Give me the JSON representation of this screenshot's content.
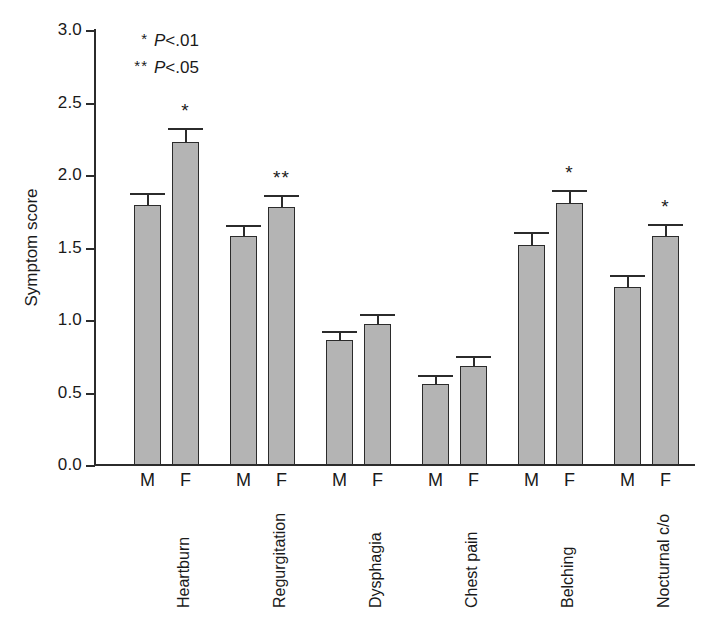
{
  "chart_data": {
    "type": "bar",
    "title": "",
    "xlabel": "",
    "ylabel": "Symptom score",
    "ylim": [
      0.0,
      3.0
    ],
    "ytick_labels": [
      "0.0",
      "0.5",
      "1.0",
      "1.5",
      "2.0",
      "2.5",
      "3.0"
    ],
    "ytick_values": [
      0.0,
      0.5,
      1.0,
      1.5,
      2.0,
      2.5,
      3.0
    ],
    "grid": false,
    "legend": "none",
    "categories": [
      "Heartburn",
      "Regurgitation",
      "Dysphagia",
      "Chest pain",
      "Belching",
      "Nocturnal c/o"
    ],
    "subgroup_labels": [
      "M",
      "F"
    ],
    "series": [
      {
        "name": "M",
        "values": [
          1.79,
          1.58,
          0.86,
          0.56,
          1.52,
          1.23
        ],
        "errors": [
          0.07,
          0.06,
          0.05,
          0.05,
          0.07,
          0.07
        ],
        "significance": [
          "",
          "",
          "",
          "",
          "",
          ""
        ]
      },
      {
        "name": "F",
        "values": [
          2.23,
          1.78,
          0.97,
          0.68,
          1.81,
          1.58
        ],
        "errors": [
          0.08,
          0.07,
          0.06,
          0.06,
          0.07,
          0.07
        ],
        "significance": [
          "*",
          "**",
          "",
          "",
          "*",
          "*"
        ]
      }
    ],
    "annotations": [
      {
        "marker": "*",
        "text": "P<.01",
        "p_italic": "P",
        "p_rest": "<.01"
      },
      {
        "marker": "**",
        "text": "P<.05",
        "p_italic": "P",
        "p_rest": "<.05"
      }
    ],
    "bar_fill_color": "#b4b4b4",
    "bar_edge_color": "#2b2b2b",
    "axis_color": "#2b2b2b"
  }
}
